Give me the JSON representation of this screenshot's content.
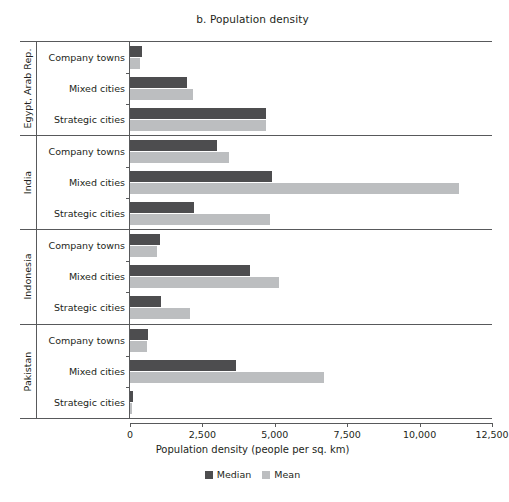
{
  "chart_data": {
    "type": "bar",
    "orientation": "horizontal",
    "title": "b. Population density",
    "xlabel": "Population density (people per sq. km)",
    "ylabel": "",
    "xlim": [
      0,
      12500
    ],
    "xticks": [
      0,
      2500,
      5000,
      7500,
      10000,
      12500
    ],
    "xtick_labels": [
      "0",
      "2,500",
      "5,000",
      "7,500",
      "10,000",
      "12,500"
    ],
    "grid": false,
    "legend_position": "bottom-center",
    "legend": [
      "Median",
      "Mean"
    ],
    "colors": {
      "median": "#4d4d4f",
      "mean": "#bcbec0",
      "axis": "#58595b",
      "text": "#231f20",
      "background": "#ffffff"
    },
    "categories": [
      "Company towns",
      "Mixed cities",
      "Strategic cities"
    ],
    "series": [
      {
        "name": "Median",
        "key": "median"
      },
      {
        "name": "Mean",
        "key": "mean"
      }
    ],
    "groups": [
      {
        "country": "Egypt, Arab Rep.",
        "rows": [
          {
            "category": "Company towns",
            "median": 420,
            "mean": 350
          },
          {
            "category": "Mixed cities",
            "median": 1980,
            "mean": 2190
          },
          {
            "category": "Strategic cities",
            "median": 4700,
            "mean": 4700
          }
        ]
      },
      {
        "country": "India",
        "rows": [
          {
            "category": "Company towns",
            "median": 3020,
            "mean": 3420
          },
          {
            "category": "Mixed cities",
            "median": 4900,
            "mean": 11350
          },
          {
            "category": "Strategic cities",
            "median": 2220,
            "mean": 4850
          }
        ]
      },
      {
        "country": "Indonesia",
        "rows": [
          {
            "category": "Company towns",
            "median": 1040,
            "mean": 940
          },
          {
            "category": "Mixed cities",
            "median": 4150,
            "mean": 5150
          },
          {
            "category": "Strategic cities",
            "median": 1060,
            "mean": 2060
          }
        ]
      },
      {
        "country": "Pakistan",
        "rows": [
          {
            "category": "Company towns",
            "median": 620,
            "mean": 590
          },
          {
            "category": "Mixed cities",
            "median": 3650,
            "mean": 6700
          },
          {
            "category": "Strategic cities",
            "median": 90,
            "mean": 60
          }
        ]
      }
    ]
  }
}
